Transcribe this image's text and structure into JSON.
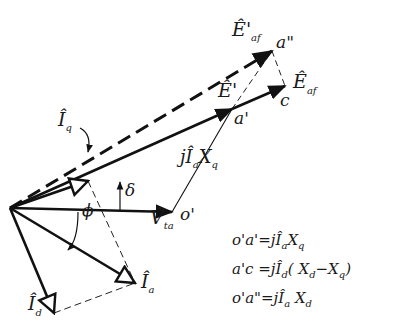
{
  "diagram": {
    "points": {
      "origin": {
        "x": 10,
        "y": 208
      },
      "o_prime": {
        "x": 172,
        "y": 212,
        "label": "o'"
      },
      "a_prime": {
        "x": 232,
        "y": 109,
        "label": "a'"
      },
      "c": {
        "x": 285,
        "y": 86,
        "label": "c"
      },
      "a_double_prime": {
        "x": 272,
        "y": 51,
        "label": "a\""
      },
      "Iq_tip": {
        "x": 88,
        "y": 181
      },
      "Ia_tip": {
        "x": 135,
        "y": 283
      },
      "Id_tip": {
        "x": 54,
        "y": 313
      }
    },
    "phasors": [
      {
        "name": "V_ta",
        "label": "V",
        "sub": "ta",
        "from": "origin",
        "to": "o_prime"
      },
      {
        "name": "E_prime",
        "label": "E'",
        "from": "origin",
        "to": "a_prime"
      },
      {
        "name": "E_af",
        "label": "E",
        "sub": "af",
        "from": "origin",
        "to": "c"
      },
      {
        "name": "E_af_prime",
        "label": "E'",
        "sub": "af",
        "from": "origin",
        "to": "a_double_prime",
        "style": "dashed"
      },
      {
        "name": "I_q",
        "label": "I",
        "sub": "q",
        "from": "origin",
        "to": "Iq_tip"
      },
      {
        "name": "I_a",
        "label": "I",
        "sub": "a",
        "from": "origin",
        "to": "Ia_tip"
      },
      {
        "name": "I_d",
        "label": "I",
        "sub": "d",
        "from": "origin",
        "to": "Id_tip"
      }
    ],
    "labels": {
      "Eaf_prime": {
        "main": "Ê",
        "prime": "'",
        "sub": "af"
      },
      "a_dd": "a\"",
      "Eaf": {
        "main": "Ê",
        "sub": "af"
      },
      "E_prime": {
        "main": "Ê",
        "prime": "'"
      },
      "c": "c",
      "a_p": "a'",
      "Iq": {
        "main": "Î",
        "sub": "q"
      },
      "delta": "δ",
      "jIaXq": {
        "j": "j",
        "main": "Î",
        "sub1": "a",
        "X": "X",
        "sub2": "q"
      },
      "o_p": "o'",
      "Vta": {
        "main": "V̂",
        "sub": "ta"
      },
      "phi": "ϕ",
      "Ia": {
        "main": "Î",
        "sub": "a"
      },
      "Id": {
        "main": "Î",
        "sub": "d"
      }
    },
    "angles": [
      {
        "name": "delta",
        "symbol": "δ",
        "between": [
          "V_ta",
          "E_prime"
        ]
      },
      {
        "name": "phi",
        "symbol": "ϕ",
        "between": [
          "V_ta",
          "I_a"
        ]
      }
    ],
    "equations": [
      {
        "lhs": "o'a'",
        "rhs_j": "=j",
        "rhs_I": "Î",
        "rhs_Isub": "a",
        "rhs_rest": "X",
        "rhs_restsub": "q",
        "tail": ""
      },
      {
        "lhs": "a'c ",
        "rhs_j": "=j",
        "rhs_I": "Î",
        "rhs_Isub": "d",
        "rhs_rest": "( X",
        "rhs_restsub": "d",
        "tail": "−X",
        "tailsub": "q",
        "close": ")"
      },
      {
        "lhs": "o'a\"",
        "rhs_j": "=j",
        "rhs_I": "Î",
        "rhs_Isub": "a",
        "rhs_rest": " X",
        "rhs_restsub": "d",
        "tail": ""
      }
    ]
  }
}
